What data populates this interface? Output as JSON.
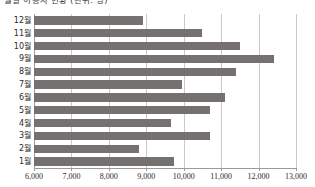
{
  "chart_data": {
    "type": "bar",
    "orientation": "horizontal",
    "title": "월별 이용자 현황 (단위: 명)",
    "xlabel": "",
    "ylabel": "",
    "categories": [
      "12월",
      "11월",
      "10월",
      "9월",
      "8월",
      "7월",
      "6월",
      "5월",
      "4월",
      "3월",
      "2월",
      "1월"
    ],
    "values": [
      8900,
      10500,
      11500,
      12400,
      11400,
      9950,
      11100,
      10700,
      9650,
      10700,
      8800,
      9750
    ],
    "series": [
      {
        "name": "이용자수",
        "values": [
          8900,
          10500,
          11500,
          12400,
          11400,
          9950,
          11100,
          10700,
          9650,
          10700,
          8800,
          9750
        ]
      }
    ],
    "xlim": [
      6000,
      13000
    ],
    "xticks": [
      6000,
      7000,
      8000,
      9000,
      10000,
      11000,
      12000,
      13000
    ],
    "xtick_labels": [
      "6,000",
      "7,000",
      "8,000",
      "9,000",
      "10,000",
      "11,000",
      "12,000",
      "13,000"
    ],
    "grid": true,
    "grid_axis": "x",
    "legend": false,
    "legend_position": "none",
    "bar_color": "#767171",
    "grid_color": "#c9c9c9",
    "axis_color": "#9a9a9a",
    "background_color": "#ffffff"
  }
}
